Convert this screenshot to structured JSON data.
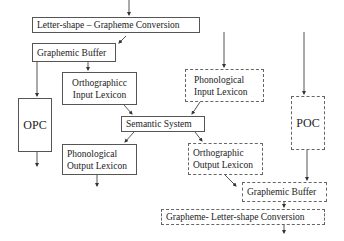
{
  "diagram": {
    "title": "",
    "reading_route": {
      "letter_shape_grapheme": "Letter-shape – Grapheme Conversion",
      "graphemic_buffer_input": "Graphemic Buffer",
      "opc": "OPC",
      "orthographic_input_lexicon": [
        "Orthographicc",
        "Input Lexicon"
      ],
      "semantic_system": "Semantic System",
      "phonological_output_lexicon": [
        "Phonological",
        "Output Lexicon"
      ]
    },
    "spelling_route": {
      "phonological_input_lexicon": [
        "Phonological",
        "Input Lexicon"
      ],
      "poc": "POC",
      "orthographic_output_lexicon": [
        "Orthographic",
        "Output Lexicon"
      ],
      "graphemic_buffer_output": "Graphemic Buffer",
      "grapheme_letter_shape": "Grapheme- Letter-shape Conversion"
    },
    "colors": {
      "line": "#555555",
      "background": "#ffffff"
    }
  }
}
